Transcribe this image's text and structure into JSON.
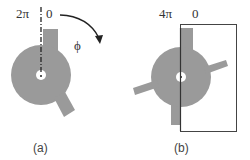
{
  "panels": {
    "a": {
      "caption": "(a)",
      "label_left": "2π",
      "label_right": "0",
      "angle_label": "ϕ"
    },
    "b": {
      "caption": "(b)",
      "label_left": "4π",
      "label_right": "0"
    }
  },
  "colors": {
    "shape_fill": "#9a9a9a",
    "line": "#333333",
    "background": "#ffffff"
  }
}
